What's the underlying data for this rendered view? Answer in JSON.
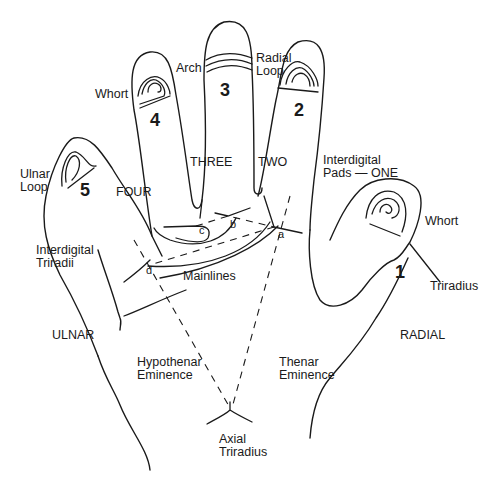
{
  "diagram": {
    "type": "palm-dermatoglyphics",
    "digits": [
      {
        "number": "1",
        "pattern_label": "Whort"
      },
      {
        "number": "2",
        "pattern_label": "Radial Loop"
      },
      {
        "number": "3",
        "pattern_label": "Arch"
      },
      {
        "number": "4",
        "pattern_label": "Whort"
      },
      {
        "number": "5",
        "pattern_label": "Ulnar Loop"
      }
    ],
    "labels": {
      "arch": "Arch",
      "radial_loop_1": "Radial",
      "radial_loop_2": "Loop",
      "whort_4": "Whort",
      "ulnar_loop_1": "Ulnar",
      "ulnar_loop_2": "Loop",
      "whort_1": "Whort",
      "triradius": "Triradius",
      "interdigital_pads_1": "Interdigital",
      "interdigital_pads_2": "Pads — ONE",
      "interdigital_triradii_1": "Interdigital",
      "interdigital_triradii_2": "Triradii",
      "mainlines": "Mainlines",
      "ulnar": "ULNAR",
      "radial": "RADIAL",
      "hypothenar_1": "Hypothenar",
      "hypothenar_2": "Eminence",
      "thenar_1": "Thenar",
      "thenar_2": "Eminence",
      "axial_1": "Axial",
      "axial_2": "Triradius"
    },
    "interdigital_areas": [
      "TWO",
      "THREE",
      "FOUR"
    ],
    "triradii": [
      "a",
      "b",
      "c",
      "d"
    ]
  }
}
